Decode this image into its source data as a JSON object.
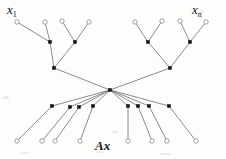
{
  "figure": {
    "type": "computation-graph",
    "width": 226,
    "height": 159,
    "background_color": "#fdfdfc",
    "stroke_color": "#6f6f72",
    "node_fill_color": "#111114",
    "node_open_color": "#ffffff",
    "node_open_stroke": "#8a8a8d"
  },
  "labels": {
    "input_first": {
      "base": "x",
      "sub": "1",
      "x": 7,
      "y": 3
    },
    "input_last": {
      "base": "x",
      "sub": "n",
      "x": 192,
      "y": 3
    },
    "output": {
      "text": "Ax",
      "x": 95,
      "y": 139
    }
  },
  "nodes": {
    "inputs": [
      {
        "id": "in1",
        "x": 17,
        "y": 22,
        "shape": "circle"
      },
      {
        "id": "in2",
        "x": 45,
        "y": 22,
        "shape": "circle"
      },
      {
        "id": "in3",
        "x": 62,
        "y": 21,
        "shape": "circle"
      },
      {
        "id": "in4",
        "x": 89,
        "y": 22,
        "shape": "circle"
      },
      {
        "id": "in5",
        "x": 135,
        "y": 22,
        "shape": "circle"
      },
      {
        "id": "in6",
        "x": 162,
        "y": 21,
        "shape": "circle"
      },
      {
        "id": "in7",
        "x": 180,
        "y": 21,
        "shape": "circle"
      },
      {
        "id": "in8",
        "x": 206,
        "y": 22,
        "shape": "circle"
      }
    ],
    "tier2": [
      {
        "id": "t2a",
        "x": 50,
        "y": 42,
        "shape": "square"
      },
      {
        "id": "t2b",
        "x": 75,
        "y": 42,
        "shape": "square"
      },
      {
        "id": "t2c",
        "x": 148,
        "y": 42,
        "shape": "square"
      },
      {
        "id": "t2d",
        "x": 190,
        "y": 42,
        "shape": "square"
      }
    ],
    "tier3": [
      {
        "id": "t3a",
        "x": 54,
        "y": 68,
        "shape": "square"
      },
      {
        "id": "t3b",
        "x": 170,
        "y": 68,
        "shape": "square"
      }
    ],
    "hub": {
      "id": "hub",
      "x": 110,
      "y": 90,
      "shape": "square"
    },
    "tier5": [
      {
        "id": "t5a",
        "x": 52,
        "y": 106,
        "shape": "square"
      },
      {
        "id": "t5b",
        "x": 70,
        "y": 107,
        "shape": "square"
      },
      {
        "id": "t5c",
        "x": 79,
        "y": 107,
        "shape": "square"
      },
      {
        "id": "t5d",
        "x": 93,
        "y": 106,
        "shape": "square"
      },
      {
        "id": "t5e",
        "x": 128,
        "y": 106,
        "shape": "square"
      },
      {
        "id": "t5f",
        "x": 138,
        "y": 106,
        "shape": "square"
      },
      {
        "id": "t5g",
        "x": 149,
        "y": 106,
        "shape": "square"
      },
      {
        "id": "t5h",
        "x": 169,
        "y": 106,
        "shape": "square"
      }
    ],
    "outputs": [
      {
        "id": "out1",
        "x": 17,
        "y": 141,
        "shape": "circle"
      },
      {
        "id": "out2",
        "x": 42,
        "y": 141,
        "shape": "circle"
      },
      {
        "id": "out3",
        "x": 55,
        "y": 141,
        "shape": "circle"
      },
      {
        "id": "out4",
        "x": 80,
        "y": 141,
        "shape": "circle"
      },
      {
        "id": "out5",
        "x": 128,
        "y": 141,
        "shape": "circle"
      },
      {
        "id": "out6",
        "x": 152,
        "y": 141,
        "shape": "circle"
      },
      {
        "id": "out7",
        "x": 167,
        "y": 141,
        "shape": "circle"
      },
      {
        "id": "out8",
        "x": 196,
        "y": 141,
        "shape": "circle"
      }
    ]
  },
  "edges": [
    [
      "in1",
      "t2a"
    ],
    [
      "in2",
      "t2a"
    ],
    [
      "in3",
      "t2b"
    ],
    [
      "in4",
      "t2b"
    ],
    [
      "in5",
      "t2c"
    ],
    [
      "in6",
      "t2c"
    ],
    [
      "in7",
      "t2d"
    ],
    [
      "in8",
      "t2d"
    ],
    [
      "t2a",
      "t3a"
    ],
    [
      "t2b",
      "t3a"
    ],
    [
      "t2c",
      "t3b"
    ],
    [
      "t2d",
      "t3b"
    ],
    [
      "t3a",
      "hub"
    ],
    [
      "t3b",
      "hub"
    ],
    [
      "hub",
      "t5a"
    ],
    [
      "hub",
      "t5b"
    ],
    [
      "hub",
      "t5c"
    ],
    [
      "hub",
      "t5d"
    ],
    [
      "hub",
      "t5e"
    ],
    [
      "hub",
      "t5f"
    ],
    [
      "hub",
      "t5g"
    ],
    [
      "hub",
      "t5h"
    ],
    [
      "t5a",
      "out1"
    ],
    [
      "t5b",
      "out2"
    ],
    [
      "t5c",
      "out3"
    ],
    [
      "t5d",
      "out4"
    ],
    [
      "t5e",
      "out5"
    ],
    [
      "t5f",
      "out6"
    ],
    [
      "t5g",
      "out7"
    ],
    [
      "t5h",
      "out8"
    ]
  ],
  "flecks": [
    {
      "x": 6,
      "y": 7,
      "w": 5,
      "h": 3
    },
    {
      "x": 200,
      "y": 10,
      "w": 4,
      "h": 3
    },
    {
      "x": 3,
      "y": 96,
      "w": 6,
      "h": 3
    },
    {
      "x": 112,
      "y": 131,
      "w": 7,
      "h": 2
    },
    {
      "x": 20,
      "y": 152,
      "w": 9,
      "h": 2
    },
    {
      "x": 160,
      "y": 153,
      "w": 11,
      "h": 2
    },
    {
      "x": 96,
      "y": 151,
      "w": 8,
      "h": 2
    }
  ]
}
